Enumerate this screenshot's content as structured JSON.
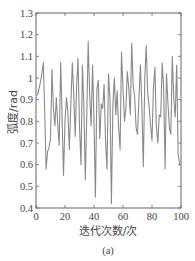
{
  "chart_data": {
    "type": "line",
    "title": "",
    "caption": "(a)",
    "xlabel": "迭代次数/次",
    "ylabel": "弧度/rad",
    "xlim": [
      0,
      100
    ],
    "ylim": [
      0.4,
      1.3
    ],
    "xticks": [
      0,
      20,
      40,
      60,
      80,
      100
    ],
    "yticks": [
      0.4,
      0.5,
      0.6,
      0.7,
      0.8,
      0.9,
      1,
      1.1,
      1.2,
      1.3
    ],
    "ytick_labels": [
      "0.4",
      "0.5",
      "0.6",
      "0.7",
      "0.8",
      "0.9",
      "1",
      "1.1",
      "1.2",
      "1.3"
    ],
    "grid": false,
    "legend": null,
    "line_color": "#8a8a8a",
    "series": [
      {
        "name": "弧度",
        "x": [
          1,
          2,
          3,
          4,
          5,
          6,
          7,
          8,
          9,
          10,
          11,
          12,
          13,
          14,
          15,
          16,
          17,
          18,
          19,
          20,
          21,
          22,
          23,
          24,
          25,
          26,
          27,
          28,
          29,
          30,
          31,
          32,
          33,
          34,
          35,
          36,
          37,
          38,
          39,
          40,
          41,
          42,
          43,
          44,
          45,
          46,
          47,
          48,
          49,
          50,
          51,
          52,
          53,
          54,
          55,
          56,
          57,
          58,
          59,
          60,
          61,
          62,
          63,
          64,
          65,
          66,
          67,
          68,
          69,
          70,
          71,
          72,
          73,
          74,
          75,
          76,
          77,
          78,
          79,
          80,
          81,
          82,
          83,
          84,
          85,
          86,
          87,
          88,
          89,
          90,
          91,
          92,
          93,
          94,
          95,
          96,
          97,
          98,
          99,
          100
        ],
        "values": [
          0.92,
          0.95,
          0.98,
          1.02,
          1.07,
          0.85,
          0.58,
          0.66,
          0.68,
          0.72,
          1.04,
          0.86,
          0.78,
          0.91,
          0.78,
          0.69,
          1.07,
          0.82,
          0.55,
          0.8,
          0.91,
          0.84,
          0.67,
          0.87,
          1.07,
          0.93,
          0.73,
          0.96,
          1.09,
          0.78,
          0.6,
          1.06,
          0.88,
          0.53,
          0.83,
          1.17,
          0.92,
          0.78,
          1.06,
          0.8,
          0.45,
          0.95,
          0.99,
          0.72,
          0.88,
          0.86,
          0.97,
          0.7,
          0.58,
          1.02,
          0.9,
          0.42,
          0.88,
          1.0,
          0.83,
          0.94,
          0.77,
          0.67,
          1.12,
          0.95,
          0.8,
          0.86,
          1.03,
          0.95,
          0.83,
          1.16,
          0.96,
          0.92,
          0.77,
          0.74,
          0.9,
          1.06,
          0.88,
          0.59,
          1.0,
          1.15,
          0.93,
          0.87,
          0.78,
          0.71,
          0.95,
          1.05,
          0.78,
          0.7,
          0.83,
          0.82,
          1.07,
          0.96,
          0.58,
          1.02,
          0.88,
          0.77,
          0.74,
          1.1,
          0.9,
          0.82,
          1.06,
          0.65,
          0.6,
          0.6
        ]
      }
    ]
  }
}
